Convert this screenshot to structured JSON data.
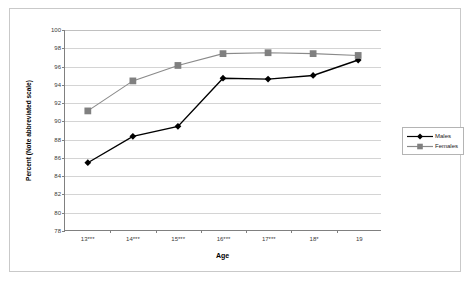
{
  "chart_data": {
    "type": "line",
    "title": "",
    "xlabel": "Age",
    "ylabel": "Percent (Note abbreviated scale)",
    "categories": [
      "13***",
      "14***",
      "15***",
      "16***",
      "17***",
      "18*",
      "19"
    ],
    "ylim": [
      78,
      100
    ],
    "ytick_labels": [
      "100",
      "98",
      "96",
      "94",
      "92",
      "90",
      "88",
      "86",
      "84",
      "82",
      "80",
      "78"
    ],
    "ytick_values": [
      100,
      98,
      96,
      94,
      92,
      90,
      88,
      86,
      84,
      82,
      80,
      78
    ],
    "grid": "horizontal",
    "legend_position": "right-outside",
    "series": [
      {
        "name": "Males",
        "color": "#000000",
        "marker": "diamond",
        "values": [
          85.4,
          88.3,
          89.4,
          94.7,
          94.6,
          95.0,
          96.7
        ]
      },
      {
        "name": "Females",
        "color": "#808080",
        "marker": "square",
        "values": [
          91.1,
          94.4,
          96.1,
          97.4,
          97.5,
          97.4,
          97.2
        ]
      }
    ]
  },
  "legend": {
    "items": [
      {
        "label": "Males"
      },
      {
        "label": "Females"
      }
    ]
  },
  "colors": {
    "males": "#000000",
    "females": "#808080",
    "gridline": "#d4d4d4",
    "axis": "#808080",
    "frame": "#c9c9c9",
    "background": "#ffffff"
  }
}
